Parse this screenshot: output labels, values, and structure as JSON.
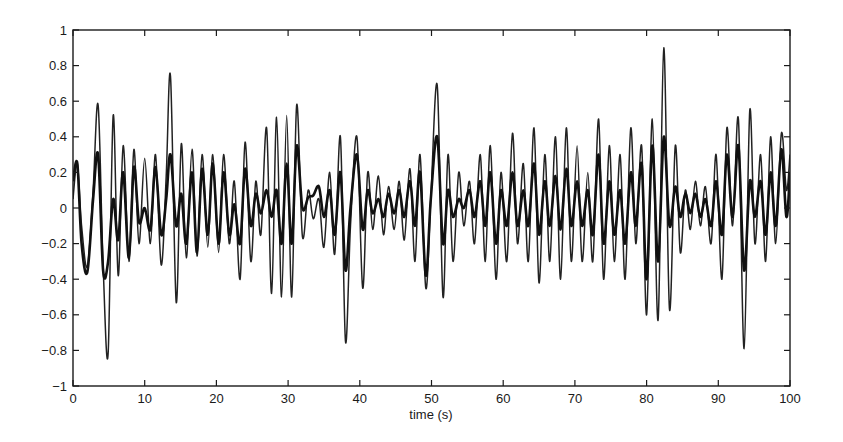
{
  "chart_data": {
    "type": "line",
    "title": "",
    "xlabel": "time (s)",
    "ylabel": "",
    "xlim": [
      0,
      100
    ],
    "ylim": [
      -1,
      1
    ],
    "grid": false,
    "legend": null,
    "xticks": [
      0,
      10,
      20,
      30,
      40,
      50,
      60,
      70,
      80,
      90,
      100
    ],
    "yticks": [
      -1,
      -0.8,
      -0.6,
      -0.4,
      -0.2,
      0,
      0.2,
      0.4,
      0.6,
      0.8,
      1
    ],
    "ytick_labels": [
      "-1",
      "-0.8",
      "-0.6",
      "-0.4",
      "-0.2",
      "0",
      "0.2",
      "0.4",
      "0.6",
      "0.8",
      "1"
    ],
    "series": [
      {
        "name": "signal-large-amplitude",
        "style": "thin",
        "color": "#222222",
        "x": [
          0,
          0.6,
          1.2,
          2.0,
          2.8,
          3.5,
          4.2,
          4.9,
          5.6,
          6.3,
          7.0,
          7.8,
          8.5,
          9.2,
          10.0,
          10.8,
          11.5,
          12.3,
          13.0,
          13.6,
          14.4,
          15.1,
          15.8,
          16.6,
          17.3,
          18.0,
          18.8,
          19.5,
          20.3,
          21.0,
          21.8,
          22.5,
          23.3,
          24.0,
          24.8,
          25.5,
          26.2,
          27.0,
          27.7,
          28.4,
          29.1,
          29.8,
          30.5,
          31.2,
          32.0,
          32.8,
          33.5,
          34.3,
          35.0,
          35.8,
          36.5,
          37.3,
          38.0,
          38.7,
          39.6,
          40.4,
          41.1,
          41.8,
          42.6,
          43.3,
          44.0,
          44.8,
          45.5,
          46.2,
          47.0,
          47.7,
          48.4,
          49.2,
          49.9,
          50.8,
          51.6,
          52.3,
          53.0,
          53.8,
          54.5,
          55.3,
          56.0,
          56.8,
          57.5,
          58.2,
          59.0,
          59.7,
          60.5,
          61.3,
          62.0,
          62.8,
          63.5,
          64.3,
          65.0,
          65.8,
          66.5,
          67.3,
          68.0,
          68.8,
          69.5,
          70.3,
          71.0,
          71.8,
          72.5,
          73.3,
          74.0,
          74.8,
          75.5,
          76.3,
          77.0,
          77.8,
          78.5,
          79.3,
          80.0,
          80.8,
          81.6,
          82.4,
          83.2,
          84.0,
          84.7,
          85.4,
          86.1,
          86.8,
          87.5,
          88.2,
          89.0,
          89.7,
          90.5,
          91.2,
          92.0,
          92.8,
          93.6,
          94.4,
          95.1,
          95.9,
          96.6,
          97.3,
          98.0,
          98.8,
          99.5,
          100
        ],
        "y": [
          0.05,
          0.25,
          -0.1,
          -0.33,
          0.1,
          0.58,
          -0.32,
          -0.82,
          0.52,
          -0.38,
          0.35,
          -0.3,
          0.33,
          -0.2,
          0.28,
          -0.2,
          0.3,
          -0.32,
          0.18,
          0.74,
          -0.53,
          0.36,
          -0.28,
          0.33,
          -0.27,
          0.3,
          -0.22,
          0.3,
          -0.25,
          0.3,
          -0.2,
          0.15,
          -0.4,
          0.37,
          -0.3,
          0.15,
          -0.15,
          0.45,
          -0.48,
          0.51,
          -0.5,
          0.52,
          -0.5,
          0.58,
          -0.16,
          0.1,
          -0.06,
          0.05,
          -0.22,
          0.2,
          -0.26,
          0.4,
          -0.75,
          -0.1,
          0.4,
          -0.45,
          0.2,
          -0.12,
          0.18,
          -0.15,
          0.12,
          -0.12,
          0.15,
          -0.18,
          0.22,
          -0.3,
          0.3,
          -0.45,
          0.05,
          0.69,
          -0.5,
          0.3,
          -0.3,
          0.2,
          -0.1,
          0.15,
          -0.2,
          0.3,
          -0.3,
          0.35,
          -0.4,
          0.2,
          -0.3,
          0.42,
          -0.2,
          0.25,
          -0.3,
          0.45,
          -0.42,
          0.3,
          -0.3,
          0.4,
          -0.4,
          0.45,
          -0.3,
          0.35,
          -0.3,
          0.2,
          -0.3,
          0.5,
          -0.4,
          0.35,
          -0.3,
          0.3,
          -0.4,
          0.45,
          -0.2,
          0.35,
          -0.6,
          0.5,
          -0.63,
          0.9,
          -0.57,
          0.35,
          -0.25,
          0.1,
          -0.12,
          0.15,
          -0.1,
          0.12,
          -0.2,
          0.3,
          -0.4,
          0.45,
          -0.1,
          0.5,
          -0.79,
          0.55,
          -0.2,
          0.3,
          -0.3,
          0.4,
          -0.2,
          0.42,
          0.1,
          0.3
        ],
        "peaks": [
          {
            "t": 3.5,
            "value": 0.58
          },
          {
            "t": 4.2,
            "value": -0.82
          },
          {
            "t": 13.6,
            "value": 0.74
          },
          {
            "t": 14.4,
            "value": -0.53
          },
          {
            "t": 39.6,
            "value": -0.75
          },
          {
            "t": 50.8,
            "value": 0.69
          },
          {
            "t": 81.6,
            "value": -0.63
          },
          {
            "t": 82.4,
            "value": 0.9
          },
          {
            "t": 93.6,
            "value": -0.79
          }
        ]
      },
      {
        "name": "signal-small-amplitude",
        "style": "thick",
        "color": "#111111",
        "x": [
          0,
          0.6,
          1.2,
          2.0,
          2.8,
          3.5,
          4.2,
          4.9,
          5.6,
          6.3,
          7.0,
          7.8,
          8.5,
          9.2,
          10.0,
          10.8,
          11.5,
          12.3,
          13.0,
          13.6,
          14.4,
          15.1,
          15.8,
          16.6,
          17.3,
          18.0,
          18.8,
          19.5,
          20.3,
          21.0,
          21.8,
          22.5,
          23.3,
          24.0,
          24.8,
          25.5,
          26.2,
          27.0,
          27.7,
          28.4,
          29.1,
          29.8,
          30.5,
          31.2,
          32.0,
          32.8,
          33.5,
          34.3,
          35.0,
          35.8,
          36.5,
          37.3,
          38.0,
          38.7,
          39.6,
          40.4,
          41.1,
          41.8,
          42.6,
          43.3,
          44.0,
          44.8,
          45.5,
          46.2,
          47.0,
          47.7,
          48.4,
          49.2,
          49.9,
          50.8,
          51.6,
          52.3,
          53.0,
          53.8,
          54.5,
          55.3,
          56.0,
          56.8,
          57.5,
          58.2,
          59.0,
          59.7,
          60.5,
          61.3,
          62.0,
          62.8,
          63.5,
          64.3,
          65.0,
          65.8,
          66.5,
          67.3,
          68.0,
          68.8,
          69.5,
          70.3,
          71.0,
          71.8,
          72.5,
          73.3,
          74.0,
          74.8,
          75.5,
          76.3,
          77.0,
          77.8,
          78.5,
          79.3,
          80.0,
          80.8,
          81.6,
          82.4,
          83.2,
          84.0,
          84.7,
          85.4,
          86.1,
          86.8,
          87.5,
          88.2,
          89.0,
          89.7,
          90.5,
          91.2,
          92.0,
          92.8,
          93.6,
          94.4,
          95.1,
          95.9,
          96.6,
          97.3,
          98.0,
          98.8,
          99.5,
          100
        ],
        "y": [
          0.15,
          0.25,
          -0.2,
          -0.36,
          0.05,
          0.3,
          -0.35,
          -0.3,
          0.05,
          -0.18,
          0.2,
          -0.28,
          0.23,
          -0.08,
          0.0,
          -0.12,
          0.23,
          -0.15,
          0.05,
          0.3,
          -0.1,
          0.08,
          -0.2,
          0.2,
          -0.25,
          0.22,
          -0.15,
          0.25,
          -0.2,
          0.2,
          -0.15,
          0.02,
          -0.2,
          0.22,
          -0.1,
          0.08,
          -0.03,
          0.1,
          -0.05,
          0.1,
          -0.2,
          0.25,
          -0.2,
          0.35,
          0.0,
          0.06,
          0.07,
          0.12,
          -0.05,
          0.1,
          -0.15,
          0.2,
          -0.35,
          0.0,
          0.3,
          -0.12,
          0.1,
          -0.03,
          0.05,
          -0.05,
          0.08,
          -0.03,
          0.1,
          -0.05,
          0.15,
          -0.1,
          0.2,
          -0.38,
          0.05,
          0.4,
          -0.2,
          0.1,
          -0.05,
          0.05,
          0.0,
          0.1,
          -0.05,
          0.15,
          -0.1,
          0.2,
          -0.2,
          0.1,
          -0.1,
          0.2,
          -0.1,
          0.1,
          -0.1,
          0.25,
          -0.15,
          0.15,
          -0.1,
          0.18,
          -0.12,
          0.22,
          -0.1,
          0.15,
          -0.1,
          0.1,
          -0.15,
          0.3,
          -0.2,
          0.15,
          -0.15,
          0.1,
          -0.2,
          0.2,
          -0.1,
          0.25,
          -0.4,
          0.35,
          -0.3,
          0.4,
          -0.1,
          0.12,
          -0.05,
          0.08,
          -0.03,
          0.08,
          -0.05,
          0.05,
          -0.1,
          0.15,
          -0.15,
          0.3,
          -0.05,
          0.35,
          -0.35,
          0.15,
          -0.05,
          0.15,
          -0.15,
          0.2,
          -0.1,
          0.33,
          -0.05,
          0.2
        ]
      }
    ],
    "plot_area_px": {
      "left": 73,
      "top": 30,
      "right": 790,
      "bottom": 386
    }
  }
}
